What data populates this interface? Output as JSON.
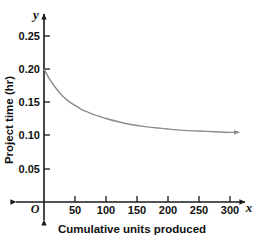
{
  "chart_data": {
    "type": "line",
    "title": "",
    "xlabel": "Cumulative units produced",
    "ylabel": "Project time (hr)",
    "x_axis_symbol": "x",
    "y_axis_symbol": "y",
    "origin_label": "O",
    "xlim": [
      0,
      320
    ],
    "ylim": [
      0,
      0.275
    ],
    "xticks": [
      50,
      100,
      150,
      200,
      250,
      300
    ],
    "xtick_labels": [
      "50",
      "100",
      "150",
      "200",
      "250",
      "300"
    ],
    "yticks": [
      0.05,
      0.1,
      0.15,
      0.2,
      0.25
    ],
    "ytick_labels": [
      "0.05",
      "0.10",
      "0.15",
      "0.20",
      "0.25"
    ],
    "grid": false,
    "legend": "none",
    "curve_color": "#8c8c8c",
    "axis_color": "#1a1a1a",
    "asymptote": 0.1,
    "start_value": 0.2,
    "arrow_end": true,
    "series": [
      {
        "name": "learning curve",
        "x": [
          0,
          10,
          20,
          30,
          40,
          50,
          60,
          70,
          80,
          90,
          100,
          120,
          140,
          160,
          180,
          200,
          225,
          250,
          275,
          300,
          315
        ],
        "y": [
          0.2,
          0.183,
          0.17,
          0.159,
          0.151,
          0.145,
          0.139,
          0.135,
          0.131,
          0.128,
          0.125,
          0.12,
          0.116,
          0.113,
          0.111,
          0.109,
          0.107,
          0.106,
          0.105,
          0.104,
          0.104
        ]
      }
    ]
  },
  "axis_labels": {
    "x_title": "Cumulative units produced",
    "y_title": "Project time (hr)",
    "x_symbol": "x",
    "y_symbol": "y",
    "origin": "O"
  },
  "ticks": {
    "y": [
      "0.25",
      "0.20",
      "0.15",
      "0.10",
      "0.05"
    ],
    "x": [
      "50",
      "100",
      "150",
      "200",
      "250",
      "300"
    ]
  }
}
